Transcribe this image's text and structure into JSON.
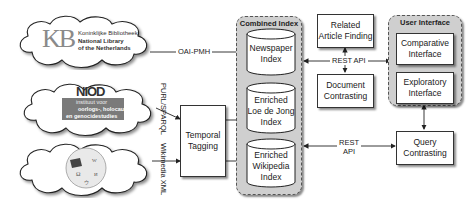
{
  "sources": {
    "kb": {
      "logo_mark": "KB",
      "line1": "Koninklijke Bibliotheek",
      "line2": "National Library",
      "line3": "of the Netherlands"
    },
    "niod": {
      "logo_mark": "NIOD",
      "line1": "instituut voor",
      "line2": "oorlogs-, holocaust-",
      "line3": "en genocidestudies"
    },
    "wikipedia": {
      "logo": "wikipedia-globe"
    }
  },
  "edges": {
    "oai_pmh": "OAI-PMH",
    "purl_sparql": "PURL/SPARQL",
    "wikimedia_xml": "Wikimedia XML",
    "rest_api_top": "REST API",
    "rest_api_bottom_line1": "REST",
    "rest_api_bottom_line2": "API"
  },
  "temporal_tagging": {
    "line1": "Temporal",
    "line2": "Tagging"
  },
  "combined_index": {
    "title": "Combined Index",
    "items": [
      {
        "line1": "Newspaper",
        "line2": "Index",
        "line3": ""
      },
      {
        "line1": "Enriched",
        "line2": "Loe de Jong",
        "line3": "Index"
      },
      {
        "line1": "Enriched",
        "line2": "Wikipedia",
        "line3": "Index"
      }
    ]
  },
  "services": {
    "related_article_finding": {
      "line1": "Related",
      "line2": "Article Finding"
    },
    "document_contrasting": {
      "line1": "Document",
      "line2": "Contrasting"
    },
    "query_contrasting": {
      "line1": "Query",
      "line2": "Contrasting"
    }
  },
  "user_interface": {
    "title": "User Interface",
    "comparative": {
      "line1": "Comparative",
      "line2": "Interface"
    },
    "exploratory": {
      "line1": "Exploratory",
      "line2": "Interface"
    }
  }
}
